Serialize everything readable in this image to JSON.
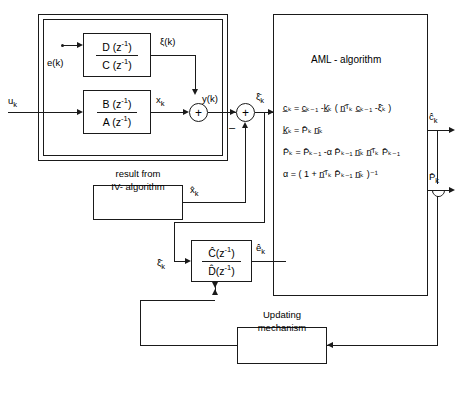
{
  "diagram": {
    "plant": {
      "label": "plant",
      "noise_filter": {
        "numerator": "D (z",
        "num_exp": "-1",
        "num_close": ")",
        "denominator": "C (z",
        "den_exp": "-1",
        "den_close": ")"
      },
      "process_filter": {
        "numerator": "B (z",
        "num_exp": "-1",
        "num_close": ")",
        "denominator": "A (z",
        "den_exp": "-1",
        "den_close": ")"
      }
    },
    "estimator_filter": {
      "numerator": "C (z",
      "num_exp": "-1",
      "num_close": ")",
      "denominator": "D (z",
      "den_exp": "-1",
      "den_close": ")"
    },
    "aml": {
      "title": "AML - algorithm",
      "equations": [
        "c̲ₖ = c̲ₖ₋₁ -k̲̄ₖ ( n̲̄ᵀₖ c̲ₖ₋₁ -ξ̄ₖ )",
        "k̲̄ₖ = P̄ₖ n̲̄ₖ",
        "P̄ₖ = P̄ₖ₋₁ -α P̄ₖ₋₁ n̲̄ₖ n̲̄ᵀₖ P̄ₖ₋₁",
        "α = ( 1 + n̲̄ᵀₖ P̄ₖ₋₁ n̲̄ₖ )⁻¹"
      ]
    },
    "iv_block": {
      "line1": "result from",
      "line2": "IV- algorithm"
    },
    "updating_block": {
      "line1": "Updating",
      "line2": "mechanism"
    },
    "signals": {
      "input_u": "u",
      "input_u_sub": "k",
      "noise_e": "e(k)",
      "xi_k": "ξ(k)",
      "x_k": "x",
      "x_k_sub": "k",
      "y_k": "y(k)",
      "xi_bar_k": "ξ̄",
      "xi_bar_k_sub": "k",
      "x_hat_k": "x̂",
      "x_hat_k_sub": "k",
      "e_hat_k": "ê",
      "e_hat_k_sub": "k",
      "c_hat_k": "ĉ",
      "c_hat_k_sub": "k",
      "p_bar_k": "P̄",
      "p_bar_k_sub": "k",
      "xi_bar_feedback": "ξ̄",
      "xi_bar_feedback_sub": "k",
      "plus": "+",
      "minus": "–"
    },
    "caption": ""
  },
  "colors": {
    "ink": "#1a1a1a",
    "background": "#ffffff"
  }
}
